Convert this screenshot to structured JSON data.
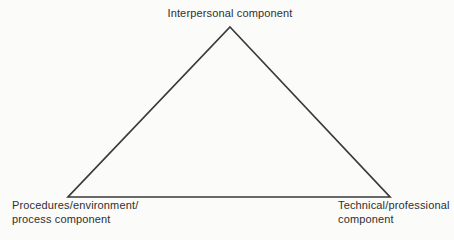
{
  "diagram": {
    "triangle": {
      "stroke_color": "#3a3a3a",
      "stroke_width": "1.7"
    },
    "labels": {
      "top": "Interpersonal component",
      "bottom_left_line1": "Procedures/environment/",
      "bottom_left_line2": "process component",
      "bottom_right_line1": "Technical/professional",
      "bottom_right_line2": "component"
    }
  }
}
